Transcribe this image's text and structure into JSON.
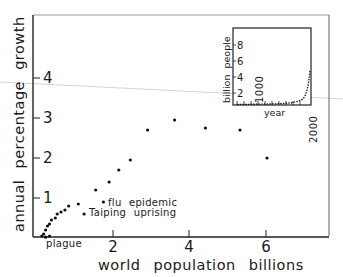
{
  "chart_data": [
    {
      "type": "scatter",
      "title": "",
      "xlabel": "world population billions",
      "ylabel": "annual percentage growth",
      "xlim": [
        0,
        7.5
      ],
      "ylim": [
        0,
        5.5
      ],
      "xticks": [
        "2",
        "4",
        "6"
      ],
      "yticks": [
        "1",
        "2",
        "3",
        "4"
      ],
      "grid": false,
      "points": [
        {
          "x": 0.15,
          "y": 0.05
        },
        {
          "x": 0.2,
          "y": 0.1
        },
        {
          "x": 0.25,
          "y": 0.2
        },
        {
          "x": 0.3,
          "y": 0.3
        },
        {
          "x": 0.35,
          "y": 0.35
        },
        {
          "x": 0.4,
          "y": 0.45
        },
        {
          "x": 0.5,
          "y": 0.5
        },
        {
          "x": 0.55,
          "y": 0.6
        },
        {
          "x": 0.65,
          "y": 0.65
        },
        {
          "x": 0.75,
          "y": 0.7
        },
        {
          "x": 0.35,
          "y": 0.05
        },
        {
          "x": 0.25,
          "y": 0.02
        },
        {
          "x": 0.85,
          "y": 0.8
        },
        {
          "x": 1.1,
          "y": 0.85
        },
        {
          "x": 1.25,
          "y": 0.6
        },
        {
          "x": 1.75,
          "y": 0.9
        },
        {
          "x": 1.55,
          "y": 1.2
        },
        {
          "x": 1.9,
          "y": 1.4
        },
        {
          "x": 2.15,
          "y": 1.7
        },
        {
          "x": 2.45,
          "y": 1.95
        },
        {
          "x": 2.9,
          "y": 2.7
        },
        {
          "x": 3.6,
          "y": 2.95
        },
        {
          "x": 4.4,
          "y": 2.75
        },
        {
          "x": 5.3,
          "y": 2.7
        },
        {
          "x": 6.0,
          "y": 2.0
        }
      ],
      "annotations": [
        {
          "text": "flu epidemic",
          "x": 1.75,
          "y": 0.9
        },
        {
          "text": "Taiping uprising",
          "x": 1.25,
          "y": 0.6
        },
        {
          "text": "plague",
          "x": 0.4,
          "y": 0.0
        }
      ]
    },
    {
      "type": "line",
      "title": "inset",
      "xlabel": "year",
      "ylabel": "billion people",
      "xticks": [
        "1000",
        "2000"
      ],
      "yticks": [
        "2",
        "4",
        "6",
        "8"
      ],
      "ylim": [
        0,
        10
      ],
      "x": [
        0,
        1000,
        1500,
        1700,
        1800,
        1900,
        1950,
        1970,
        1990,
        2000,
        2010
      ],
      "values": [
        0.2,
        0.3,
        0.45,
        0.6,
        1.0,
        1.6,
        2.5,
        3.7,
        5.3,
        6.1,
        6.9
      ]
    }
  ],
  "labels": {
    "y_axis": "annual percentage growth",
    "x_axis": "world population billions",
    "x_ticks": [
      "2",
      "4",
      "6"
    ],
    "y_ticks": [
      "1",
      "2",
      "3",
      "4"
    ],
    "flu": "flu epidemic",
    "taiping": "Taiping uprising",
    "plague": "plague",
    "inset_y": "billion people",
    "inset_x": "year",
    "inset_y_ticks": [
      "2",
      "4",
      "6",
      "8"
    ],
    "inset_x_ticks": [
      "1000",
      "2000"
    ]
  }
}
